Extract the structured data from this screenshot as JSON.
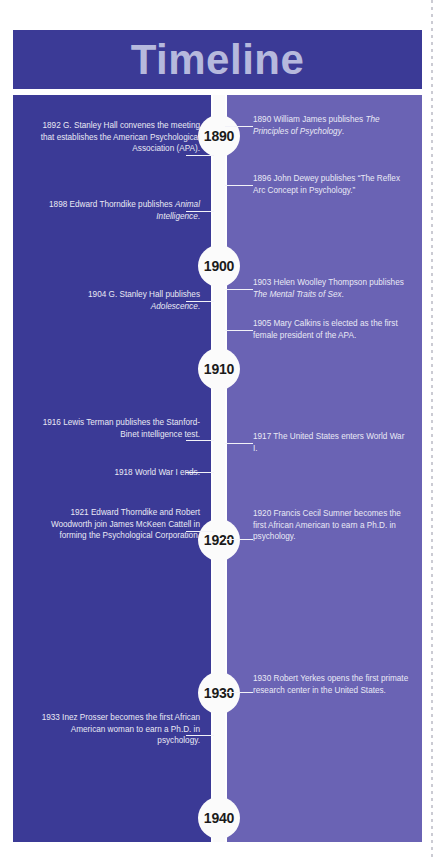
{
  "header": {
    "title": "Timeline"
  },
  "colors": {
    "panel_left": "#3b3a96",
    "panel_right": "#6a63b4",
    "spine": "#fbfbfb",
    "title_text": "#b6b9dd",
    "body_text": "#e9e9f4",
    "year_text": "#1b1b1b",
    "page_background": "#ffffff"
  },
  "timeline": {
    "year_markers": [
      {
        "label": "1890",
        "top": 20
      },
      {
        "label": "1900",
        "top": 150
      },
      {
        "label": "1910",
        "top": 253
      },
      {
        "label": "1920",
        "top": 424
      },
      {
        "label": "1930",
        "top": 577
      },
      {
        "label": "1940",
        "top": 702
      }
    ],
    "events": [
      {
        "side": "left",
        "year": "1892",
        "top": 25,
        "line_top": 60,
        "parts": [
          {
            "text": "1892 G. Stanley Hall convenes the meeting that establishes the American Psychological Association (APA).",
            "italic": false
          }
        ]
      },
      {
        "side": "right",
        "year": "1890",
        "top": 19,
        "line_top": 31,
        "parts": [
          {
            "text": "1890 William James publishes ",
            "italic": false
          },
          {
            "text": "The Principles of Psychology",
            "italic": true
          },
          {
            "text": ".",
            "italic": false
          }
        ]
      },
      {
        "side": "right",
        "year": "1896",
        "top": 78,
        "line_top": 90,
        "parts": [
          {
            "text": "1896 John Dewey publishes “The Reflex Arc Concept in Psychology.”",
            "italic": false
          }
        ]
      },
      {
        "side": "left",
        "year": "1898",
        "top": 104,
        "line_top": 116,
        "parts": [
          {
            "text": "1898 Edward Thorndike publishes ",
            "italic": false
          },
          {
            "text": "Animal Intelligence",
            "italic": true
          },
          {
            "text": ".",
            "italic": false
          }
        ]
      },
      {
        "side": "right",
        "year": "1903",
        "top": 182,
        "line_top": 194,
        "parts": [
          {
            "text": "1903 Helen Woolley Thompson publishes ",
            "italic": false
          },
          {
            "text": "The Mental Traits of Sex",
            "italic": true
          },
          {
            "text": ".",
            "italic": false
          }
        ]
      },
      {
        "side": "left",
        "year": "1904",
        "top": 194,
        "line_top": 206,
        "parts": [
          {
            "text": "1904 G. Stanley Hall publishes ",
            "italic": false
          },
          {
            "text": "Adolescence",
            "italic": true
          },
          {
            "text": ".",
            "italic": false
          }
        ]
      },
      {
        "side": "right",
        "year": "1905",
        "top": 223,
        "line_top": 235,
        "parts": [
          {
            "text": "1905 Mary Calkins is elected as the first female president of the APA.",
            "italic": false
          }
        ]
      },
      {
        "side": "left",
        "year": "1916",
        "top": 322,
        "line_top": 345,
        "parts": [
          {
            "text": "1916 Lewis Terman publishes the Stanford-Binet intelligence test.",
            "italic": false
          }
        ]
      },
      {
        "side": "right",
        "year": "1917",
        "top": 336,
        "line_top": 348,
        "parts": [
          {
            "text": "1917 The United States enters World War I.",
            "italic": false
          }
        ]
      },
      {
        "side": "left",
        "year": "1918",
        "top": 372,
        "line_top": 377,
        "parts": [
          {
            "text": "1918 World War I ends.",
            "italic": false
          }
        ]
      },
      {
        "side": "left",
        "year": "1921",
        "top": 412,
        "line_top": 436,
        "parts": [
          {
            "text": "1921 Edward Thorndike and Robert Woodworth join James McKeen Cattell in forming the Psychological Corporation.",
            "italic": false
          }
        ]
      },
      {
        "side": "right",
        "year": "1920",
        "top": 413,
        "line_top": 444,
        "parts": [
          {
            "text": "1920 Francis Cecil Sumner becomes the first African American to earn a Ph.D. in psychology.",
            "italic": false
          }
        ]
      },
      {
        "side": "right",
        "year": "1930",
        "top": 578,
        "line_top": 597,
        "parts": [
          {
            "text": "1930 Robert Yerkes opens the first primate research center in the United States.",
            "italic": false
          }
        ]
      },
      {
        "side": "left",
        "year": "1933",
        "top": 617,
        "line_top": 640,
        "parts": [
          {
            "text": "1933 Inez Prosser becomes the first African American woman to earn a Ph.D. in psychology.",
            "italic": false
          }
        ]
      }
    ]
  }
}
